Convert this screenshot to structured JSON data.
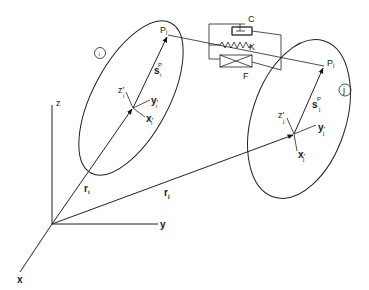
{
  "diagram": {
    "title": "",
    "global_frame": {
      "origin": [
        52,
        224
      ],
      "axes": [
        {
          "name": "x",
          "label": "x",
          "end": [
            20,
            272
          ]
        },
        {
          "name": "y",
          "label": "y",
          "end": [
            158,
            224
          ]
        },
        {
          "name": "z",
          "label": "z",
          "end": [
            52,
            105
          ]
        }
      ]
    },
    "bodies": [
      {
        "id": "i",
        "badge": "i",
        "ellipse": {
          "cx": 131,
          "cy": 98,
          "rx": 85,
          "ry": 38,
          "rotate": -62
        },
        "origin": [
          133,
          108
        ],
        "position_vector": {
          "label": "r",
          "sub": "i"
        },
        "point": {
          "label": "P",
          "sub": "j",
          "pos": [
            168,
            35
          ]
        },
        "local_vector": {
          "label": "s",
          "sub": "i",
          "sup": "P"
        },
        "local_axes": [
          {
            "label": "x",
            "sub": "i",
            "prime": "′"
          },
          {
            "label": "y",
            "sub": "i",
            "prime": "′"
          },
          {
            "label": "z",
            "sub": "i",
            "prime": "′"
          }
        ]
      },
      {
        "id": "j",
        "badge": "j",
        "ellipse": {
          "cx": 299,
          "cy": 119,
          "rx": 82,
          "ry": 47,
          "rotate": -72
        },
        "origin": [
          294,
          134
        ],
        "position_vector": {
          "label": "r",
          "sub": "j"
        },
        "point": {
          "label": "P",
          "sub": "j",
          "pos": [
            324,
            66
          ]
        },
        "local_vector": {
          "label": "s",
          "sub": "j",
          "sup": "P"
        },
        "local_axes": [
          {
            "label": "x",
            "sub": "j",
            "prime": "′"
          },
          {
            "label": "y",
            "sub": "j",
            "prime": "′"
          },
          {
            "label": "z",
            "sub": "j",
            "prime": "′"
          }
        ]
      }
    ],
    "force_element": {
      "components": [
        {
          "symbol": "damper",
          "label": "C"
        },
        {
          "symbol": "spring",
          "label": "K"
        },
        {
          "symbol": "friction",
          "label": "F"
        }
      ]
    }
  }
}
